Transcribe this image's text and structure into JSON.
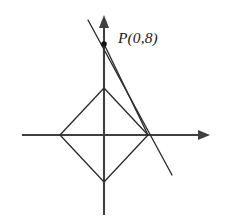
{
  "figure": {
    "background_color": "#ffffff",
    "axis_color": "#3f3f3f",
    "shape_color": "#2b2b2b",
    "point_color": "#141414"
  },
  "labels": {
    "point_p": "P(0,8)"
  },
  "chart_data": {
    "type": "scatter",
    "title": "",
    "xlabel": "",
    "ylabel": "",
    "grid": false,
    "legend": false,
    "axes": {
      "origin_px": [
        104,
        135
      ],
      "units_per_px": 0.1758,
      "x_axis": {
        "start_px": [
          22,
          135
        ],
        "end_px": [
          210,
          135
        ],
        "arrow_at": "end",
        "tick_labels": []
      },
      "y_axis": {
        "start_px": [
          104,
          215
        ],
        "end_px": [
          104,
          16
        ],
        "arrow_at": "end",
        "tick_labels": []
      }
    },
    "points": [
      {
        "name": "P",
        "label": "P(0,8)",
        "coords": [
          0,
          8
        ],
        "px": [
          104,
          44
        ],
        "marker": "filled-circle",
        "radius_px": 2.8
      }
    ],
    "polygons": [
      {
        "name": "rhombus",
        "closed": true,
        "vertices_px": [
          [
            104,
            88
          ],
          [
            148,
            135
          ],
          [
            104,
            182
          ],
          [
            60,
            135
          ]
        ],
        "vertex_names": [
          "top",
          "right",
          "bottom",
          "left"
        ]
      }
    ],
    "lines": [
      {
        "name": "secant-through-p",
        "from_px": [
          88,
          20
        ],
        "to_px": [
          172,
          175
        ],
        "passes_through": [
          "P",
          "rhombus-right-vertex"
        ]
      },
      {
        "name": "chord-p-to-right-vertex",
        "from_px": [
          104,
          44
        ],
        "to_px": [
          148,
          135
        ]
      }
    ]
  }
}
